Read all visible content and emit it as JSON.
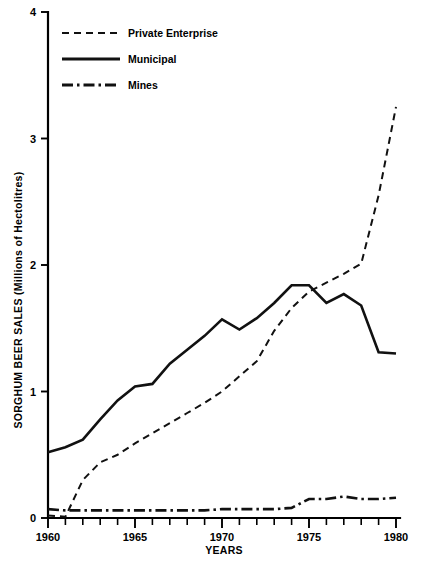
{
  "chart_data": {
    "type": "line",
    "title": "",
    "xlabel": "YEARS",
    "ylabel": "SORGHUM BEER SALES (Millions of Hectolitres)",
    "xlim": [
      1960,
      1980
    ],
    "ylim": [
      0,
      4
    ],
    "grid": false,
    "legend_position": "top-left",
    "x_major_ticks": [
      1960,
      1965,
      1970,
      1975,
      1980
    ],
    "x_major_tick_labels": [
      "1960",
      "1965",
      "1970",
      "1975",
      "1980"
    ],
    "x_minor_tick_step": 1,
    "y_ticks": [
      0,
      1,
      2,
      3,
      4
    ],
    "y_tick_labels": [
      "0",
      "1",
      "2",
      "3",
      "4"
    ],
    "x": [
      1960,
      1961,
      1962,
      1963,
      1964,
      1965,
      1966,
      1967,
      1968,
      1969,
      1970,
      1971,
      1972,
      1973,
      1974,
      1975,
      1976,
      1977,
      1978,
      1979,
      1980
    ],
    "series": [
      {
        "name": "Private Enterprise",
        "style": "dashed",
        "values": [
          0.02,
          0.01,
          0.3,
          0.44,
          0.5,
          0.59,
          0.67,
          0.75,
          0.83,
          0.91,
          1.0,
          1.12,
          1.24,
          1.48,
          1.66,
          1.79,
          1.86,
          1.93,
          2.01,
          2.55,
          3.25
        ]
      },
      {
        "name": "Municipal",
        "style": "solid",
        "values": [
          0.52,
          0.56,
          0.62,
          0.78,
          0.93,
          1.04,
          1.06,
          1.22,
          1.33,
          1.44,
          1.57,
          1.49,
          1.58,
          1.7,
          1.84,
          1.84,
          1.7,
          1.77,
          1.68,
          1.31,
          1.3
        ]
      },
      {
        "name": "Mines",
        "style": "dashdot",
        "values": [
          0.07,
          0.06,
          0.06,
          0.06,
          0.06,
          0.06,
          0.06,
          0.06,
          0.06,
          0.06,
          0.07,
          0.07,
          0.07,
          0.07,
          0.08,
          0.15,
          0.15,
          0.17,
          0.15,
          0.15,
          0.16
        ]
      }
    ]
  },
  "legend": {
    "items": [
      {
        "label": "Private Enterprise",
        "style": "dashed"
      },
      {
        "label": "Municipal",
        "style": "solid"
      },
      {
        "label": "Mines",
        "style": "dashdot"
      }
    ]
  },
  "colors": {
    "ink": "#111111",
    "background": "#ffffff"
  }
}
